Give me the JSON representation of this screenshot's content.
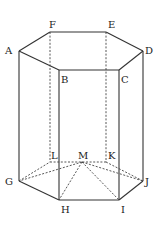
{
  "diagram": {
    "points": {
      "A": {
        "x": 19,
        "y": 51,
        "label": "A",
        "lx": 5,
        "ly": 54
      },
      "B": {
        "x": 59,
        "y": 70,
        "label": "B",
        "lx": 61,
        "ly": 83
      },
      "C": {
        "x": 119,
        "y": 70,
        "label": "C",
        "lx": 121,
        "ly": 83
      },
      "D": {
        "x": 143,
        "y": 51,
        "label": "D",
        "lx": 145,
        "ly": 54
      },
      "E": {
        "x": 106,
        "y": 32,
        "label": "E",
        "lx": 108,
        "ly": 28
      },
      "F": {
        "x": 50,
        "y": 32,
        "label": "F",
        "lx": 49,
        "ly": 28
      },
      "G": {
        "x": 19,
        "y": 181,
        "label": "G",
        "lx": 5,
        "ly": 185
      },
      "H": {
        "x": 59,
        "y": 200,
        "label": "H",
        "lx": 61,
        "ly": 213
      },
      "I": {
        "x": 119,
        "y": 200,
        "label": "I",
        "lx": 121,
        "ly": 213
      },
      "J": {
        "x": 143,
        "y": 181,
        "label": "J",
        "lx": 145,
        "ly": 185
      },
      "K": {
        "x": 106,
        "y": 162,
        "label": "K",
        "lx": 108,
        "ly": 159
      },
      "L": {
        "x": 50,
        "y": 162,
        "label": "L",
        "lx": 51,
        "ly": 159
      },
      "M": {
        "x": 82,
        "y": 162,
        "label": "M",
        "lx": 78,
        "ly": 159
      }
    },
    "solid_edges": [
      [
        "A",
        "B"
      ],
      [
        "B",
        "C"
      ],
      [
        "C",
        "D"
      ],
      [
        "D",
        "E"
      ],
      [
        "E",
        "F"
      ],
      [
        "F",
        "A"
      ],
      [
        "A",
        "G"
      ],
      [
        "B",
        "H"
      ],
      [
        "C",
        "I"
      ],
      [
        "D",
        "J"
      ],
      [
        "G",
        "H"
      ],
      [
        "H",
        "I"
      ],
      [
        "I",
        "J"
      ]
    ],
    "dashed_edges": [
      [
        "F",
        "L"
      ],
      [
        "E",
        "K"
      ],
      [
        "G",
        "L"
      ],
      [
        "L",
        "K"
      ],
      [
        "K",
        "J"
      ],
      [
        "M",
        "G"
      ],
      [
        "M",
        "H"
      ],
      [
        "M",
        "I"
      ],
      [
        "M",
        "J"
      ]
    ]
  }
}
